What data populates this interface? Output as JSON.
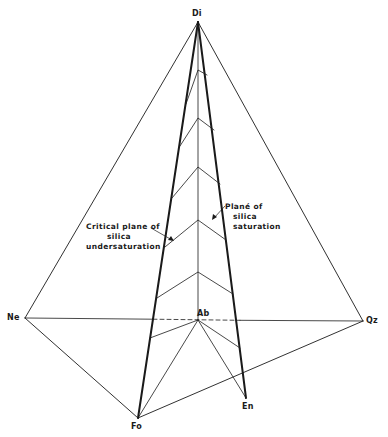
{
  "diagram": {
    "type": "tetrahedron",
    "colors": {
      "ink": "#1a1a1a",
      "background": "#ffffff"
    },
    "vertices": {
      "Di": {
        "label": "Di",
        "x": 198,
        "y": 22
      },
      "Ne": {
        "label": "Ne",
        "x": 25,
        "y": 318
      },
      "Qz": {
        "label": "Qz",
        "x": 363,
        "y": 321
      },
      "Ab": {
        "label": "Ab",
        "x": 198,
        "y": 320
      },
      "Fo": {
        "label": "Fo",
        "x": 138,
        "y": 418
      },
      "En": {
        "label": "En",
        "x": 246,
        "y": 398
      }
    },
    "annotations": {
      "critical_plane": {
        "lines": [
          "Critical plane of",
          "silica",
          "undersaturation"
        ]
      },
      "saturation_plane": {
        "lines": [
          "Plané of",
          "silica",
          "saturation"
        ]
      }
    }
  }
}
